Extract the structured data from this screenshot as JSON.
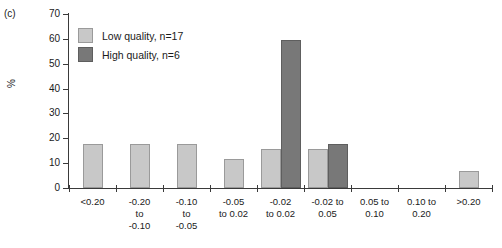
{
  "panel": {
    "label": "(c)"
  },
  "chart_data": {
    "type": "bar",
    "title": "",
    "subtitle": "",
    "xlabel": "",
    "ylabel": "%",
    "ylim": [
      0,
      70
    ],
    "yticks": [
      "0",
      "10",
      "20",
      "30",
      "40",
      "50",
      "60",
      "70"
    ],
    "grid": false,
    "legend_position": "top-left",
    "categories": [
      "<0.20",
      "-0.20\nto\n-0.10",
      "-0.10\nto\n-0.05",
      "-0.05\nto 0.02",
      "-0.02\nto 0.02",
      "-0.02 to\n0.05",
      "0.05 to\n0.10",
      "0.10 to\n0.20",
      ">0.20"
    ],
    "series": [
      {
        "name": "Low quality, n=17",
        "color": "#c8c8c8",
        "values": [
          17.6,
          17.6,
          17.6,
          11.8,
          15.7,
          15.7,
          0,
          0,
          6.8
        ]
      },
      {
        "name": "High quality, n=6",
        "color": "#787878",
        "values": [
          0,
          0,
          0,
          0,
          59.5,
          17.6,
          0,
          0,
          0
        ]
      }
    ]
  },
  "legend": {
    "items": [
      {
        "label": "Low quality, n=17",
        "swatch": "low"
      },
      {
        "label": "High quality, n=6",
        "swatch": "high"
      }
    ]
  }
}
